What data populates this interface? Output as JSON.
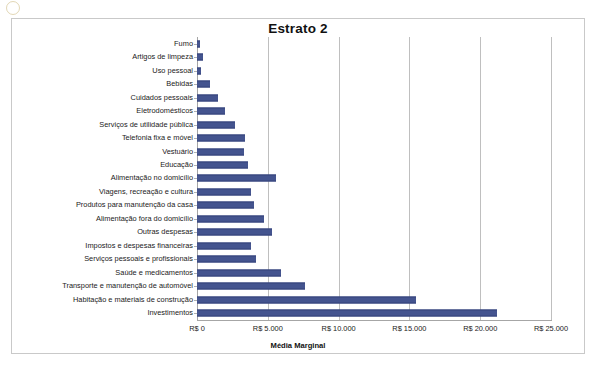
{
  "chart_data": {
    "type": "bar",
    "orientation": "horizontal",
    "title": "Estrato 2",
    "xlabel": "Média Marginal",
    "ylabel": "",
    "xlim": [
      0,
      25000
    ],
    "xticks": [
      0,
      5000,
      10000,
      15000,
      20000,
      25000
    ],
    "xtick_labels": [
      "R$ 0",
      "R$ 5.000",
      "R$ 10.000",
      "R$ 15.000",
      "R$ 20.000",
      "R$ 25.000"
    ],
    "grid": true,
    "legend": false,
    "series_color": "#44548f",
    "categories": [
      "Fumo",
      "Artigos de limpeza",
      "Uso pessoal",
      "Bebidas",
      "Cuidados pessoais",
      "Eletrodomésticos",
      "Serviços de utilidade pública",
      "Telefonia fixa e móvel",
      "Vestuário",
      "Educação",
      "Alimentação no domicílio",
      "Viagens, recreação e cultura",
      "Produtos para manutenção da casa",
      "Alimentação fora do domicílio",
      "Outras despesas",
      "Impostos e despesas financeiras",
      "Serviços pessoais e profissionais",
      "Saúde e medicamentos",
      "Transporte e manutenção de automóvel",
      "Habitação e materiais de construção",
      "Investimentos"
    ],
    "values": [
      200,
      400,
      250,
      900,
      1500,
      2000,
      2700,
      3400,
      3300,
      3600,
      5600,
      3800,
      4000,
      4700,
      5300,
      3800,
      4200,
      5900,
      7600,
      15500,
      21200
    ]
  }
}
